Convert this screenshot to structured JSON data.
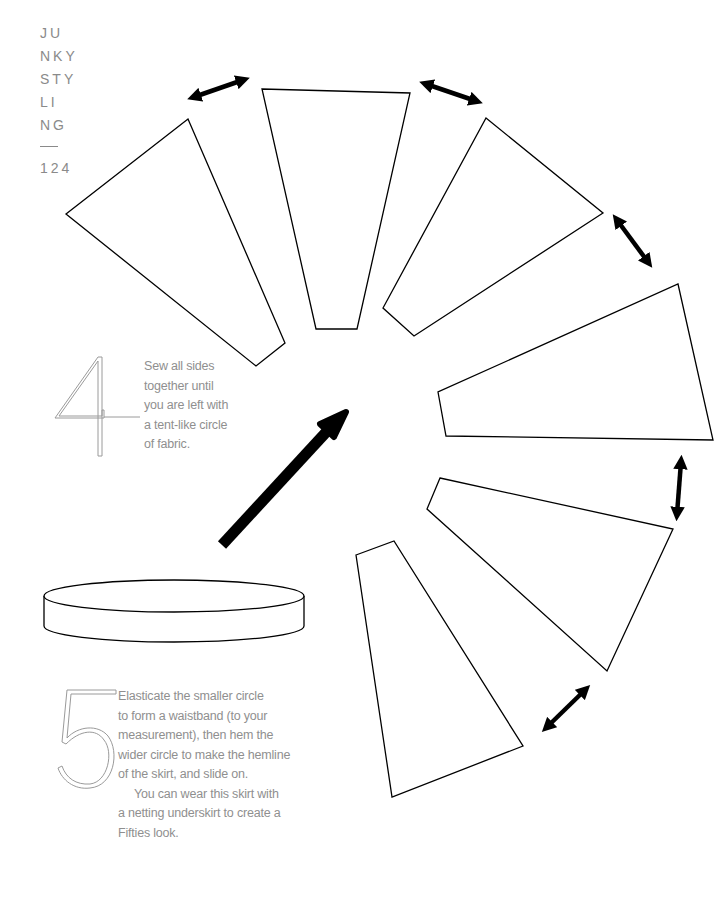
{
  "header": {
    "lines": [
      "JU",
      "NKY",
      "STY",
      "LI",
      "NG"
    ],
    "page_number": "124"
  },
  "steps": [
    {
      "number": "4",
      "lines": [
        "Sew all sides",
        "together until",
        "you are left with",
        "a tent-like circle",
        "of fabric."
      ]
    },
    {
      "number": "5",
      "lines": [
        "Elasticate the smaller circle",
        "to form a waistband (to your",
        "measurement), then hem the",
        "wider circle to make the hemline",
        "of the skirt, and slide on."
      ],
      "note_lines": [
        "You can wear this skirt with",
        "a netting underskirt to create a",
        "Fifties look."
      ]
    }
  ],
  "diagram": {
    "panel_count": 6,
    "double_arrow_count": 5,
    "stroke_color": "#000000",
    "text_color": "#8f8f8f"
  }
}
